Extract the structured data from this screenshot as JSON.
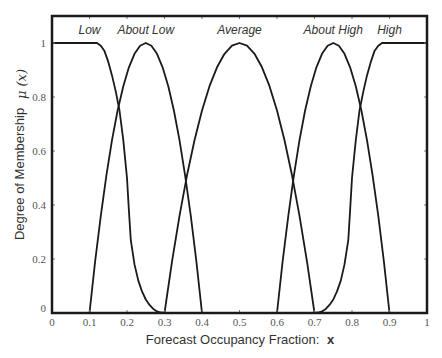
{
  "chart_data": {
    "type": "line",
    "title": "",
    "xlabel": "Forecast Occupancy Fraction:",
    "xlabel_var": "x",
    "ylabel": "Degree of Membership",
    "ylabel_symbol": "μ (x)",
    "xlim": [
      0,
      1
    ],
    "ylim": [
      0,
      1.1
    ],
    "grid": false,
    "legend": "none",
    "x_ticks": [
      0,
      0.1,
      0.2,
      0.3,
      0.4,
      0.5,
      0.6,
      0.7,
      0.8,
      0.9,
      1
    ],
    "x_tick_labels": [
      "0",
      "0.1",
      "0.2",
      "0.3",
      "0.4",
      "0.5",
      "0.6",
      "0.7",
      "0.8",
      "0.9",
      "1"
    ],
    "y_ticks": [
      0,
      0.2,
      0.4,
      0.6,
      0.8,
      1
    ],
    "y_tick_labels": [
      "0",
      "0.2",
      "0.4",
      "0.6",
      "0.8",
      "1"
    ],
    "series": [
      {
        "name": "Low",
        "label_x": 0.1,
        "x": [
          0,
          0.12,
          0.13,
          0.14,
          0.15,
          0.16,
          0.17,
          0.18,
          0.19,
          0.2,
          0.205,
          0.21,
          0.22,
          0.23,
          0.24,
          0.25,
          0.26,
          0.27,
          0.28,
          0.29,
          0.3
        ],
        "values": [
          1,
          1,
          0.99,
          0.97,
          0.93,
          0.88,
          0.82,
          0.75,
          0.64,
          0.5,
          0.38,
          0.27,
          0.18,
          0.12,
          0.08,
          0.05,
          0.03,
          0.015,
          0.006,
          0.002,
          0
        ]
      },
      {
        "name": "About Low",
        "label_x": 0.25,
        "peak": 0.25,
        "support": [
          0.1,
          0.4
        ],
        "x": [
          0.1,
          0.115,
          0.13,
          0.145,
          0.16,
          0.175,
          0.19,
          0.205,
          0.22,
          0.235,
          0.25,
          0.265,
          0.28,
          0.295,
          0.31,
          0.325,
          0.34,
          0.355,
          0.37,
          0.385,
          0.4
        ],
        "values": [
          0,
          0.19,
          0.36,
          0.51,
          0.64,
          0.75,
          0.84,
          0.91,
          0.96,
          0.99,
          1,
          0.99,
          0.96,
          0.91,
          0.84,
          0.75,
          0.64,
          0.51,
          0.36,
          0.19,
          0
        ]
      },
      {
        "name": "Average",
        "label_x": 0.5,
        "peak": 0.5,
        "support": [
          0.3,
          0.7
        ],
        "x": [
          0.3,
          0.32,
          0.34,
          0.36,
          0.38,
          0.4,
          0.42,
          0.44,
          0.46,
          0.48,
          0.5,
          0.52,
          0.54,
          0.56,
          0.58,
          0.6,
          0.62,
          0.64,
          0.66,
          0.68,
          0.7
        ],
        "values": [
          0,
          0.19,
          0.36,
          0.51,
          0.64,
          0.75,
          0.84,
          0.91,
          0.96,
          0.99,
          1,
          0.99,
          0.96,
          0.91,
          0.84,
          0.75,
          0.64,
          0.51,
          0.36,
          0.19,
          0
        ]
      },
      {
        "name": "About High",
        "label_x": 0.75,
        "peak": 0.75,
        "support": [
          0.6,
          0.9
        ],
        "x": [
          0.6,
          0.615,
          0.63,
          0.645,
          0.66,
          0.675,
          0.69,
          0.705,
          0.72,
          0.735,
          0.75,
          0.765,
          0.78,
          0.795,
          0.81,
          0.825,
          0.84,
          0.855,
          0.87,
          0.885,
          0.9
        ],
        "values": [
          0,
          0.19,
          0.36,
          0.51,
          0.64,
          0.75,
          0.84,
          0.91,
          0.96,
          0.99,
          1,
          0.99,
          0.96,
          0.91,
          0.84,
          0.75,
          0.64,
          0.51,
          0.36,
          0.19,
          0
        ]
      },
      {
        "name": "High",
        "label_x": 0.9,
        "x": [
          0.7,
          0.71,
          0.72,
          0.73,
          0.74,
          0.75,
          0.76,
          0.77,
          0.78,
          0.79,
          0.795,
          0.8,
          0.81,
          0.82,
          0.83,
          0.84,
          0.85,
          0.86,
          0.87,
          0.88,
          1
        ],
        "values": [
          0,
          0.002,
          0.006,
          0.015,
          0.03,
          0.05,
          0.08,
          0.12,
          0.18,
          0.27,
          0.38,
          0.5,
          0.64,
          0.75,
          0.82,
          0.88,
          0.93,
          0.97,
          0.99,
          1,
          1
        ]
      }
    ]
  },
  "colors": {
    "curve": "#1a1a1a",
    "frame": "#1a1a1a",
    "text": "#333333",
    "tick_text": "#555555",
    "background": "#ffffff"
  }
}
